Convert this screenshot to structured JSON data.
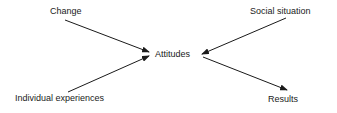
{
  "diagram": {
    "center": {
      "label": "Attitudes"
    },
    "inputs": [
      {
        "label": "Change"
      },
      {
        "label": "Social situation"
      },
      {
        "label": "Individual experiences"
      }
    ],
    "outputs": [
      {
        "label": "Results"
      }
    ],
    "edges": [
      {
        "from": "Change",
        "to": "Attitudes"
      },
      {
        "from": "Social situation",
        "to": "Attitudes"
      },
      {
        "from": "Individual experiences",
        "to": "Attitudes"
      },
      {
        "from": "Attitudes",
        "to": "Results"
      }
    ],
    "colors": {
      "line": "#1a1a1a",
      "background": "#ffffff"
    }
  }
}
